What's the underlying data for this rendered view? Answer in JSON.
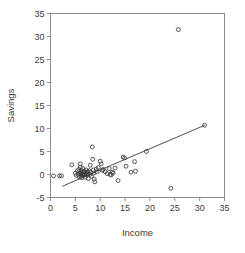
{
  "chart_data": {
    "type": "scatter",
    "title": "",
    "xlabel": "Income",
    "ylabel": "Savings",
    "xlim": [
      0,
      35
    ],
    "ylim": [
      -5,
      35
    ],
    "xticks": [
      0,
      5,
      10,
      15,
      20,
      25,
      30,
      35
    ],
    "yticks": [
      -5,
      0,
      5,
      10,
      15,
      20,
      25,
      30,
      35
    ],
    "xtick_labels": [
      "0",
      "5",
      "10",
      "15",
      "20",
      "25",
      "30",
      "35"
    ],
    "ytick_labels": [
      "-5",
      "0",
      "5",
      "10",
      "15",
      "20",
      "25",
      "30",
      "35"
    ],
    "grid": false,
    "legend": false,
    "marker": "open-circle",
    "marker_color": "#3a3a3a",
    "line_color": "#3a3a3a",
    "frame_color": "#8c8c8c",
    "background": "#ffffff",
    "series": [
      {
        "name": "observations",
        "points": [
          [
            0.6,
            -0.3
          ],
          [
            1.8,
            -0.3
          ],
          [
            2.2,
            -0.3
          ],
          [
            4.3,
            2.1
          ],
          [
            5.0,
            0.3
          ],
          [
            5.2,
            -0.2
          ],
          [
            5.4,
            0.8
          ],
          [
            5.6,
            0.0
          ],
          [
            5.7,
            1.1
          ],
          [
            5.8,
            -0.5
          ],
          [
            5.9,
            0.4
          ],
          [
            6.0,
            2.3
          ],
          [
            6.0,
            1.6
          ],
          [
            6.1,
            0.2
          ],
          [
            6.1,
            -0.4
          ],
          [
            6.2,
            0.9
          ],
          [
            6.2,
            0.0
          ],
          [
            6.3,
            -0.7
          ],
          [
            6.4,
            0.5
          ],
          [
            6.5,
            1.3
          ],
          [
            6.5,
            0.1
          ],
          [
            6.6,
            -0.2
          ],
          [
            6.8,
            0.7
          ],
          [
            6.9,
            0.0
          ],
          [
            7.0,
            -0.6
          ],
          [
            7.1,
            0.4
          ],
          [
            7.2,
            1.0
          ],
          [
            7.3,
            -0.1
          ],
          [
            7.4,
            0.6
          ],
          [
            7.5,
            0.2
          ],
          [
            7.6,
            -0.9
          ],
          [
            7.8,
            0.8
          ],
          [
            7.9,
            0.0
          ],
          [
            8.0,
            2.0
          ],
          [
            8.1,
            0.5
          ],
          [
            8.2,
            -0.4
          ],
          [
            8.4,
            6.0
          ],
          [
            8.5,
            3.3
          ],
          [
            8.6,
            1.0
          ],
          [
            8.7,
            0.3
          ],
          [
            8.8,
            -1.0
          ],
          [
            8.9,
            -1.6
          ],
          [
            9.2,
            1.2
          ],
          [
            9.4,
            0.6
          ],
          [
            9.6,
            1.5
          ],
          [
            10.0,
            2.9
          ],
          [
            10.2,
            2.3
          ],
          [
            10.4,
            0.9
          ],
          [
            10.6,
            1.1
          ],
          [
            11.0,
            0.6
          ],
          [
            11.4,
            0.2
          ],
          [
            11.8,
            1.3
          ],
          [
            12.0,
            0.0
          ],
          [
            12.2,
            -0.1
          ],
          [
            12.4,
            0.5
          ],
          [
            12.6,
            0.3
          ],
          [
            13.0,
            1.4
          ],
          [
            13.6,
            -1.3
          ],
          [
            14.6,
            3.8
          ],
          [
            14.9,
            3.6
          ],
          [
            15.2,
            1.8
          ],
          [
            16.2,
            0.5
          ],
          [
            16.9,
            2.8
          ],
          [
            17.1,
            0.7
          ],
          [
            19.3,
            5.0
          ],
          [
            24.2,
            -3.0
          ],
          [
            25.7,
            31.5
          ],
          [
            31.0,
            10.7
          ]
        ]
      }
    ],
    "fit_line": {
      "name": "regression-line",
      "x_start": 2.5,
      "y_start": -2.5,
      "x_end": 31.0,
      "y_end": 10.7
    }
  }
}
